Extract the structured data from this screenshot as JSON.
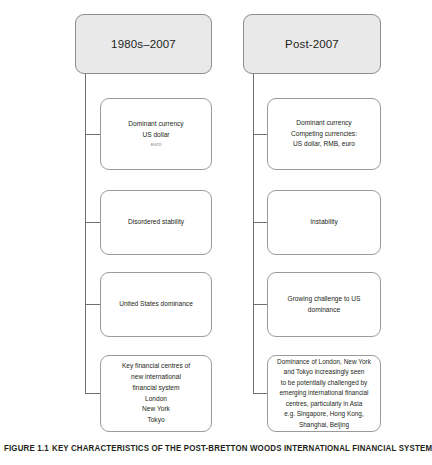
{
  "figure": {
    "caption_label": "FIGURE 1.1",
    "caption_text": "KEY CHARACTERISTICS OF THE POST-BRETTON WOODS INTERNATIONAL FINANCIAL SYSTEM"
  },
  "colors": {
    "header_fill": "#e9e9e9",
    "header_border": "#8c8c8c",
    "node_fill": "#ffffff",
    "node_border": "#9b9b9b",
    "connector": "#6f6f6f",
    "text": "#231f20",
    "faint_text": "#8e8e8e"
  },
  "columns": [
    {
      "id": "left",
      "header": "1980s–2007",
      "nodes": [
        {
          "id": "left-currency",
          "lines": [
            {
              "text": "Dominant currency",
              "faint": false
            },
            {
              "text": "US dollar",
              "faint": false
            },
            {
              "text": "euro",
              "faint": true
            }
          ]
        },
        {
          "id": "left-stability",
          "lines": [
            {
              "text": "Disordered stability",
              "faint": false
            }
          ]
        },
        {
          "id": "left-dominance",
          "lines": [
            {
              "text": "United States dominance",
              "faint": false
            }
          ]
        },
        {
          "id": "left-centres",
          "lines": [
            {
              "text": "Key financial centres of",
              "faint": false
            },
            {
              "text": "new international",
              "faint": false
            },
            {
              "text": "financial system",
              "faint": false
            },
            {
              "text": "London",
              "faint": false
            },
            {
              "text": "New York",
              "faint": false
            },
            {
              "text": "Tokyo",
              "faint": false
            }
          ]
        }
      ]
    },
    {
      "id": "right",
      "header": "Post-2007",
      "nodes": [
        {
          "id": "right-currency",
          "lines": [
            {
              "text": "Dominant currency",
              "faint": false
            },
            {
              "text": "Competing currencies:",
              "faint": false
            },
            {
              "text": "US dollar, RMB, euro",
              "faint": false
            }
          ]
        },
        {
          "id": "right-instability",
          "lines": [
            {
              "text": "Instability",
              "faint": false
            }
          ]
        },
        {
          "id": "right-challenge",
          "lines": [
            {
              "text": "Growing challenge to US",
              "faint": false
            },
            {
              "text": "dominance",
              "faint": false
            }
          ]
        },
        {
          "id": "right-centres",
          "lines": [
            {
              "text": "Dominance of London, New York",
              "faint": false
            },
            {
              "text": "and Tokyo increasingly seen",
              "faint": false
            },
            {
              "text": "to be potentially challenged by",
              "faint": false
            },
            {
              "text": "emerging international financial",
              "faint": false
            },
            {
              "text": "centres, particularly in Asia",
              "faint": false
            },
            {
              "text": "e.g. Singapore, Hong Kong,",
              "faint": false
            },
            {
              "text": "Shanghai, Beijing",
              "faint": false
            }
          ]
        }
      ]
    }
  ]
}
